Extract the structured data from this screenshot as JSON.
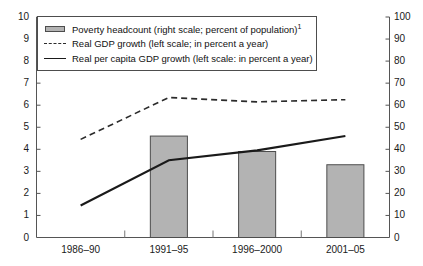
{
  "chart_data": {
    "type": "bar",
    "title": "",
    "subtitle": "",
    "xlabel": "",
    "ylabel": "",
    "categories": [
      "1986–90",
      "1991–95",
      "1996–2000",
      "2001–05"
    ],
    "left_axis": {
      "label": "in percent a year",
      "min": 0,
      "max": 10,
      "step": 1,
      "ticks": [
        "0",
        "1",
        "2",
        "3",
        "4",
        "5",
        "6",
        "7",
        "8",
        "9",
        "10"
      ]
    },
    "right_axis": {
      "label": "percent of population",
      "min": 0,
      "max": 100,
      "step": 10,
      "ticks": [
        "0",
        "10",
        "20",
        "30",
        "40",
        "50",
        "60",
        "70",
        "80",
        "90",
        "100"
      ]
    },
    "grid": false,
    "legend_position": "top-left",
    "series": [
      {
        "name": "Poverty headcount (right scale; percent of population)",
        "footnote": "1",
        "type": "bar",
        "axis": "right",
        "color": "#b3b3b3",
        "edge_color": "#4d4d4d",
        "values": [
          null,
          46,
          39,
          33
        ]
      },
      {
        "name": "Real GDP growth (left scale; in percent a year)",
        "type": "line",
        "style": "dashed",
        "axis": "left",
        "color": "#2b2b2b",
        "values": [
          4.45,
          6.35,
          6.15,
          6.25
        ]
      },
      {
        "name": "Real per capita GDP growth (left scale: in percent a year)",
        "type": "line",
        "style": "solid",
        "axis": "left",
        "color": "#1a1a1a",
        "values": [
          1.45,
          3.5,
          3.95,
          4.6
        ]
      }
    ]
  },
  "legend": {
    "items": [
      {
        "marker": "bar-swatch",
        "label": "Poverty headcount (right scale; percent of population)",
        "footnote": "1"
      },
      {
        "marker": "dashed-line-swatch",
        "label": "Real GDP growth (left scale; in percent a year)",
        "footnote": ""
      },
      {
        "marker": "solid-line-swatch",
        "label": "Real per capita GDP growth (left scale: in percent a year)",
        "footnote": ""
      }
    ]
  }
}
